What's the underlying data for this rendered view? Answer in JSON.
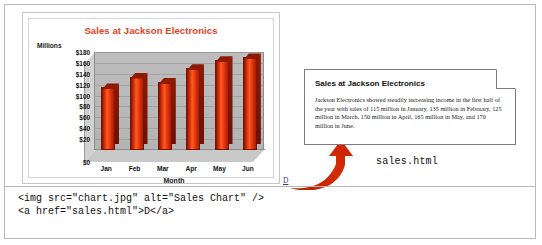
{
  "chart_panel": {
    "title": "Sales at Jackson Electronics",
    "y_axis_title": "Millions",
    "x_axis_title": "Month",
    "link_label": "D"
  },
  "chart_data": {
    "type": "bar",
    "title": "Sales at Jackson Electronics",
    "categories": [
      "Jan",
      "Feb",
      "Mar",
      "Apr",
      "May",
      "Jun"
    ],
    "values": [
      115,
      135,
      125,
      150,
      165,
      170
    ],
    "xlabel": "Month",
    "ylabel": "Millions",
    "ylim": [
      0,
      180
    ],
    "yticks": [
      "$0",
      "$20",
      "$40",
      "$60",
      "$80",
      "$100",
      "$120",
      "$140",
      "$160",
      "$180"
    ],
    "ytick_values": [
      0,
      20,
      40,
      60,
      80,
      100,
      120,
      140,
      160,
      180
    ],
    "grid": true,
    "legend": "none",
    "bar_color": "#e8390f",
    "title_color": "#e8401c",
    "style": "3d-column"
  },
  "document": {
    "heading": "Sales at Jackson Electronics",
    "body": "Jackson Electronics showed steadily increasing income in the first half of the year with sales of 115 million in January, 135 million in February, 125 million in March, 150 million in April, 165 million in May, and 170 million in June.",
    "filename": "sales.html"
  },
  "code": {
    "line1": "<img src=\"chart.jpg\" alt=\"Sales Chart\" />",
    "line2": "<a href=\"sales.html\">D</a>"
  },
  "colors": {
    "accent_red": "#c0250a",
    "arrow_red": "#cc2200",
    "link_blue": "#2b3ea8",
    "frame_gray": "#b9b9b9"
  }
}
